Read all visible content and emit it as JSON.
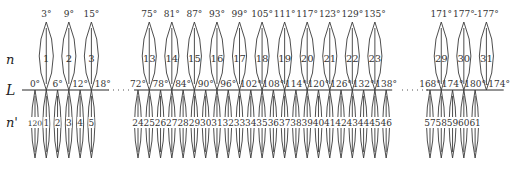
{
  "labels": {
    "upper_row": "n",
    "axis": "L",
    "lower_row": "n'"
  },
  "colors": {
    "line": "#3a3a3a",
    "text": "#333333",
    "background": "#ffffff"
  },
  "groups": [
    {
      "name": "left",
      "axis_start_x": 22,
      "origin_x": 35,
      "px_per_deg": 3.76,
      "ticks": [
        {
          "deg": 0,
          "label": "0°"
        },
        {
          "deg": 6,
          "label": "6°"
        },
        {
          "deg": 12,
          "label": "12°"
        },
        {
          "deg": 18,
          "label": "18°"
        }
      ],
      "six_degree_zones": [
        {
          "center_deg": 3,
          "center_label": "3°",
          "number": "1"
        },
        {
          "center_deg": 9,
          "center_label": "9°",
          "number": "2"
        },
        {
          "center_deg": 15,
          "center_label": "15°",
          "number": "3"
        }
      ],
      "three_degree_zones": [
        {
          "center_deg": 0,
          "number": "120"
        },
        {
          "center_deg": 3,
          "number": "1"
        },
        {
          "center_deg": 6,
          "number": "2"
        },
        {
          "center_deg": 9,
          "number": "3"
        },
        {
          "center_deg": 12,
          "number": "4"
        },
        {
          "center_deg": 15,
          "number": "5"
        }
      ]
    },
    {
      "name": "middle",
      "origin_x": 138,
      "origin_deg": 72,
      "px_per_deg": 3.76,
      "ticks": [
        {
          "deg": 72,
          "label": "72°"
        },
        {
          "deg": 78,
          "label": "78°"
        },
        {
          "deg": 84,
          "label": "84°"
        },
        {
          "deg": 90,
          "label": "90°"
        },
        {
          "deg": 96,
          "label": "96°"
        },
        {
          "deg": 102,
          "label": "102°"
        },
        {
          "deg": 108,
          "label": "108°"
        },
        {
          "deg": 114,
          "label": "114°"
        },
        {
          "deg": 120,
          "label": "120°"
        },
        {
          "deg": 126,
          "label": "126°"
        },
        {
          "deg": 132,
          "label": "132°"
        },
        {
          "deg": 138,
          "label": "138°"
        }
      ],
      "six_degree_zones": [
        {
          "center_deg": 75,
          "center_label": "75°",
          "number": "13"
        },
        {
          "center_deg": 81,
          "center_label": "81°",
          "number": "14"
        },
        {
          "center_deg": 87,
          "center_label": "87°",
          "number": "15"
        },
        {
          "center_deg": 93,
          "center_label": "93°",
          "number": "16"
        },
        {
          "center_deg": 99,
          "center_label": "99°",
          "number": "17"
        },
        {
          "center_deg": 105,
          "center_label": "105°",
          "number": "18"
        },
        {
          "center_deg": 111,
          "center_label": "111°",
          "number": "19"
        },
        {
          "center_deg": 117,
          "center_label": "117°",
          "number": "20"
        },
        {
          "center_deg": 123,
          "center_label": "123°",
          "number": "21"
        },
        {
          "center_deg": 129,
          "center_label": "129°",
          "number": "22"
        },
        {
          "center_deg": 135,
          "center_label": "135°",
          "number": "23"
        }
      ],
      "three_degree_zones": [
        {
          "center_deg": 72,
          "number": "24"
        },
        {
          "center_deg": 75,
          "number": "25"
        },
        {
          "center_deg": 78,
          "number": "26"
        },
        {
          "center_deg": 81,
          "number": "27"
        },
        {
          "center_deg": 84,
          "number": "28"
        },
        {
          "center_deg": 87,
          "number": "29"
        },
        {
          "center_deg": 90,
          "number": "30"
        },
        {
          "center_deg": 93,
          "number": "31"
        },
        {
          "center_deg": 96,
          "number": "32"
        },
        {
          "center_deg": 99,
          "number": "33"
        },
        {
          "center_deg": 102,
          "number": "34"
        },
        {
          "center_deg": 105,
          "number": "35"
        },
        {
          "center_deg": 108,
          "number": "36"
        },
        {
          "center_deg": 111,
          "number": "37"
        },
        {
          "center_deg": 114,
          "number": "38"
        },
        {
          "center_deg": 117,
          "number": "39"
        },
        {
          "center_deg": 120,
          "number": "40"
        },
        {
          "center_deg": 123,
          "number": "41"
        },
        {
          "center_deg": 126,
          "number": "42"
        },
        {
          "center_deg": 129,
          "number": "43"
        },
        {
          "center_deg": 132,
          "number": "44"
        },
        {
          "center_deg": 135,
          "number": "45"
        },
        {
          "center_deg": 138,
          "number": "46"
        }
      ]
    },
    {
      "name": "right",
      "origin_x": 430,
      "origin_deg": 168,
      "px_per_deg": 3.76,
      "ticks": [
        {
          "deg": 168,
          "label": "168°"
        },
        {
          "deg": 174,
          "label": "174°"
        },
        {
          "deg": 180,
          "label": "180°"
        },
        {
          "deg": 186,
          "label": "-174°"
        }
      ],
      "six_degree_zones": [
        {
          "center_deg": 171,
          "center_label": "171°",
          "number": "29"
        },
        {
          "center_deg": 177,
          "center_label": "177°",
          "number": "30"
        },
        {
          "center_deg": 183,
          "center_label": "-177°",
          "number": "31"
        }
      ],
      "three_degree_zones": [
        {
          "center_deg": 168,
          "number": "57"
        },
        {
          "center_deg": 171,
          "number": "58"
        },
        {
          "center_deg": 174,
          "number": "59"
        },
        {
          "center_deg": 177,
          "number": "60"
        },
        {
          "center_deg": 180,
          "number": "61"
        }
      ]
    }
  ],
  "gaps": [
    {
      "from_x": 108,
      "to_x": 132,
      "text": "· · · ·"
    },
    {
      "from_x": 402,
      "to_x": 428,
      "text": "· · · ·"
    }
  ]
}
